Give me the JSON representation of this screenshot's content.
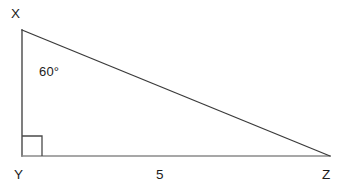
{
  "figure": {
    "kind": "right-triangle-diagram",
    "background_color": "#ffffff",
    "stroke_color": "#3a3a3a",
    "base_stroke_color": "#8a8a8a",
    "text_color": "#1c1c1c"
  },
  "labels": {
    "vertex_top": "X",
    "vertex_right_angle": "Y",
    "vertex_right": "Z",
    "angle_at_x": "60°",
    "side_yz_length": "5"
  },
  "geometry": {
    "vertex_top": {
      "x": 22,
      "y": 30
    },
    "vertex_right_angle": {
      "x": 22,
      "y": 156
    },
    "vertex_right": {
      "x": 330,
      "y": 156
    },
    "right_angle_marker_size": 20,
    "stroke_width": 1.3
  }
}
